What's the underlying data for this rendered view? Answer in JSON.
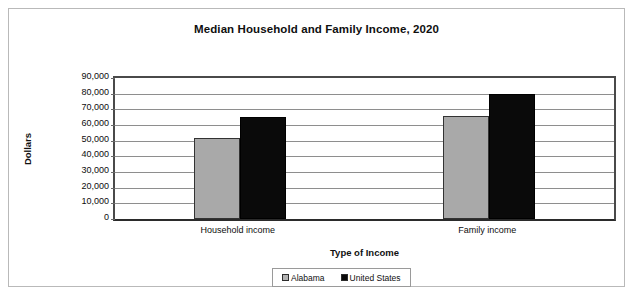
{
  "chart_data": {
    "type": "bar",
    "title": "Median Household and Family Income, 2020",
    "xlabel": "Type of Income",
    "ylabel": "Dollars",
    "categories": [
      "Household income",
      "Family income"
    ],
    "series": [
      {
        "name": "Alabama",
        "color": "#a9a9a9",
        "values": [
          51700,
          66000
        ]
      },
      {
        "name": "United States",
        "color": "#0a0a0a",
        "values": [
          65000,
          80000
        ]
      }
    ],
    "ylim": [
      0,
      90000
    ],
    "ytick_step": 10000,
    "ytick_labels": [
      "90,000",
      "80,000",
      "70,000",
      "60,000",
      "50,000",
      "40,000",
      "30,000",
      "20,000",
      "10,000",
      "0"
    ],
    "ytick_values": [
      90000,
      80000,
      70000,
      60000,
      50000,
      40000,
      30000,
      20000,
      10000,
      0
    ],
    "grid": true,
    "legend_position": "bottom",
    "legend_entries": [
      "Alabama",
      "United States"
    ]
  }
}
